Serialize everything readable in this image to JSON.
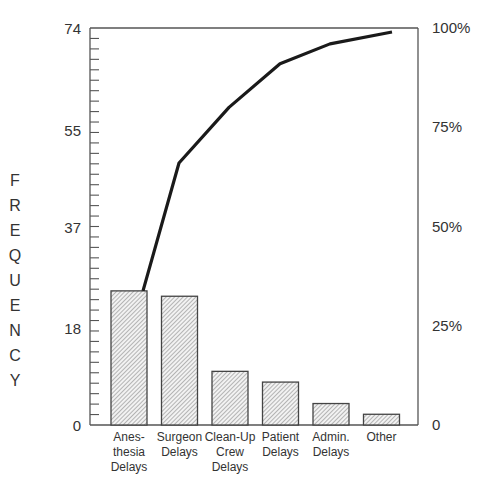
{
  "chart_data": {
    "type": "bar",
    "subtype": "pareto",
    "title": "",
    "xlabel": "",
    "ylabel": "FREQUENCY",
    "ylabel_letters": [
      "F",
      "R",
      "E",
      "Q",
      "U",
      "E",
      "N",
      "C",
      "Y"
    ],
    "categories": [
      [
        "Anes-",
        "thesia",
        "Delays"
      ],
      [
        "Surgeon",
        "Delays"
      ],
      [
        "Clean-Up",
        "Crew",
        "Delays"
      ],
      [
        "Patient",
        "Delays"
      ],
      [
        "Admin.",
        "Delays"
      ],
      [
        "Other"
      ]
    ],
    "category_names": [
      "Anesthesia Delays",
      "Surgeon Delays",
      "Clean-Up Crew Delays",
      "Patient Delays",
      "Admin. Delays",
      "Other"
    ],
    "series": [
      {
        "name": "Frequency",
        "type": "bar",
        "axis": "left",
        "values": [
          25,
          24,
          10,
          8,
          4,
          2
        ]
      },
      {
        "name": "Cumulative %",
        "type": "line",
        "axis": "right",
        "values": [
          34,
          66,
          80,
          91,
          96,
          99
        ]
      }
    ],
    "left_axis": {
      "ticks": [
        "0",
        "18",
        "37",
        "55",
        "74"
      ],
      "tick_values": [
        0,
        18,
        37,
        55,
        74
      ],
      "ylim": [
        0,
        74
      ]
    },
    "right_axis": {
      "ticks": [
        "0",
        "25%",
        "50%",
        "75%",
        "100%"
      ],
      "tick_values": [
        0,
        25,
        50,
        75,
        100
      ],
      "ylim": [
        0,
        100
      ]
    },
    "grid": false,
    "legend": "none",
    "bar_fill": "diagonal-hatch",
    "colors": {
      "bar_stroke": "#444444",
      "hatch": "#888888",
      "line": "#1a1a1a",
      "axis": "#555555"
    }
  }
}
